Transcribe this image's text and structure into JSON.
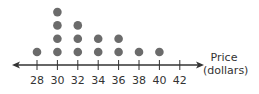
{
  "chart_data": {
    "type": "dot_plot",
    "title": "",
    "xlabel": "Price (dollars)",
    "xlabel_lines": [
      "Price",
      "(dollars)"
    ],
    "ylabel": "",
    "x_ticks": [
      28,
      30,
      32,
      34,
      36,
      38,
      40,
      42
    ],
    "categories": [
      "28",
      "30",
      "32",
      "34",
      "36",
      "38",
      "40",
      "42"
    ],
    "values": [
      1,
      4,
      3,
      2,
      2,
      1,
      1,
      0
    ],
    "xlim": [
      27,
      44
    ],
    "grid": false,
    "legend": null,
    "axis_arrows": "both",
    "dot_color": "#6b6b6b",
    "axis_color": "#333333"
  }
}
